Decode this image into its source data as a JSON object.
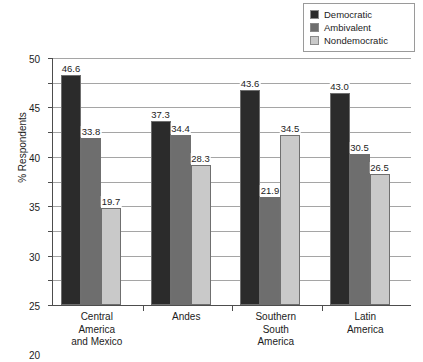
{
  "chart_data": {
    "type": "bar",
    "title": "",
    "xlabel": "",
    "ylabel": "% Respondents",
    "ylim": [
      0,
      50
    ],
    "ytick_step": 5,
    "grid": true,
    "legend_position": "top-right",
    "categories": [
      "Central\nAmerica\nand Mexico",
      "Andes",
      "Southern\nSouth\nAmerica",
      "Latin\nAmerica"
    ],
    "category_lines": [
      [
        "Central",
        "America",
        "and Mexico"
      ],
      [
        "Andes"
      ],
      [
        "Southern",
        "South",
        "America"
      ],
      [
        "Latin",
        "America"
      ]
    ],
    "ytick_labels": [
      "50",
      "45",
      "40",
      "35",
      "30",
      "25",
      "20",
      "15",
      "10",
      "5",
      "0"
    ],
    "series": [
      {
        "name": "Democratic",
        "color": "#2b2b2b",
        "values": [
          46.6,
          37.3,
          43.6,
          43.0
        ],
        "labels": [
          "46.6",
          "37.3",
          "43.6",
          "43.0"
        ]
      },
      {
        "name": "Ambivalent",
        "color": "#6e6e6e",
        "values": [
          33.8,
          34.4,
          21.9,
          30.5
        ],
        "labels": [
          "33.8",
          "34.4",
          "21.9",
          "30.5"
        ]
      },
      {
        "name": "Nondemocratic",
        "color": "#c9c9c9",
        "values": [
          19.7,
          28.3,
          34.5,
          26.5
        ],
        "labels": [
          "19.7",
          "28.3",
          "34.5",
          "26.5"
        ]
      }
    ]
  },
  "legend": {
    "items": [
      {
        "label": "Democratic",
        "color": "#2b2b2b"
      },
      {
        "label": "Ambivalent",
        "color": "#6e6e6e"
      },
      {
        "label": "Nondemocratic",
        "color": "#c9c9c9"
      }
    ]
  },
  "axis": {
    "y_title": "% Respondents"
  },
  "caption": {
    "text": ""
  }
}
